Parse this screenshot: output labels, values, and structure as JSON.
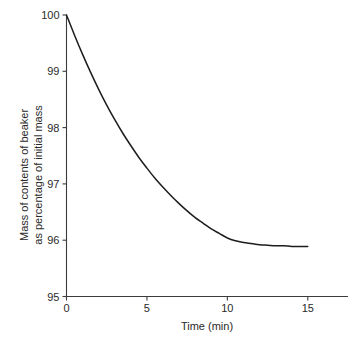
{
  "chart_data": {
    "type": "line",
    "title": "",
    "xlabel": "Time (min)",
    "ylabel": "Mass of contents of beaker as percentage of initial mass",
    "ylabel_line1": "Mass of contents of beaker",
    "ylabel_line2": "as percentage of initial mass",
    "xlim": [
      0,
      17.5
    ],
    "ylim": [
      95,
      100
    ],
    "xticks": [
      0,
      5,
      10,
      15
    ],
    "xtick_labels": [
      "0",
      "5",
      "10",
      "15"
    ],
    "yticks": [
      95,
      96,
      97,
      98,
      99,
      100
    ],
    "ytick_labels": [
      "95",
      "96",
      "97",
      "98",
      "99",
      "100"
    ],
    "grid": false,
    "legend": null,
    "series": [
      {
        "name": "Mass of contents of beaker",
        "color": "#1c1c1c",
        "x": [
          0,
          0.5,
          1,
          1.5,
          2,
          2.5,
          3,
          3.5,
          4,
          4.5,
          5,
          5.5,
          6,
          6.5,
          7,
          7.5,
          8,
          8.5,
          9,
          9.5,
          10,
          10.5,
          11,
          11.5,
          12,
          12.5,
          13,
          13.5,
          14,
          14.5,
          15
        ],
        "values": [
          100.0,
          99.64,
          99.3,
          98.98,
          98.68,
          98.4,
          98.14,
          97.9,
          97.68,
          97.47,
          97.28,
          97.1,
          96.94,
          96.79,
          96.65,
          96.52,
          96.4,
          96.3,
          96.2,
          96.12,
          96.04,
          95.99,
          95.96,
          95.94,
          95.92,
          95.91,
          95.9,
          95.9,
          95.89,
          95.89,
          95.89
        ]
      }
    ]
  }
}
